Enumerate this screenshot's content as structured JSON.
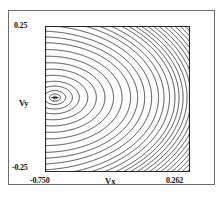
{
  "figure": {
    "background_color": "#ffffff",
    "frame_color": "#6e6e6e",
    "caption_fragment": ""
  },
  "chart_data": {
    "type": "line",
    "subtype": "contour",
    "title": "",
    "xlabel": "Vx",
    "ylabel": "Vy",
    "xlim": [
      -0.75,
      0.262
    ],
    "ylim": [
      -0.25,
      0.25
    ],
    "xticklabels": [
      "-0.750",
      "0.262"
    ],
    "yticklabels": [
      "-0.25",
      "0.25"
    ],
    "xtickvalues": [
      -0.75,
      0.262
    ],
    "ytickvalues": [
      -0.25,
      0.25
    ],
    "grid": false,
    "legend": false,
    "legend_position": "none",
    "line_color": "#1a1a1a",
    "line_width": 0.8,
    "n_contours": 30,
    "annotations": [
      {
        "name": "minimum-marker",
        "glyph": "-",
        "x": -0.68,
        "y": 0.005,
        "description": "dash marking the potential minimum at the centre of the innermost closed contour"
      }
    ],
    "extremum": {
      "kind": "minimum",
      "x": -0.68,
      "y": 0.005
    },
    "contours": {
      "center_x": -0.68,
      "center_y": 0.005,
      "description": "nested closed contours about a minimum near the left edge; levels open toward the right and become dense, near-vertical arcs at the right boundary",
      "levels_normalized": [
        0.02,
        0.05,
        0.09,
        0.14,
        0.19,
        0.25,
        0.31,
        0.37,
        0.43,
        0.49,
        0.55,
        0.6,
        0.65,
        0.7,
        0.75,
        0.79,
        0.83,
        0.87,
        0.9,
        0.93,
        0.96,
        0.99,
        1.02,
        1.05,
        1.08,
        1.11,
        1.14,
        1.17,
        1.2,
        1.23
      ]
    }
  },
  "axes": {
    "x_label": "Vx",
    "y_label": "Vy",
    "x_min_label": "-0.750",
    "x_max_label": "0.262",
    "y_min_label": "-0.25",
    "y_max_label": "0.25"
  }
}
